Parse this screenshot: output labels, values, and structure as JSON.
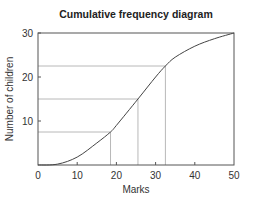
{
  "chart_data": {
    "type": "line",
    "title": "Cumulative frequency diagram",
    "xlabel": "Marks",
    "ylabel": "Number of children",
    "xlim": [
      0,
      50
    ],
    "ylim": [
      0,
      30
    ],
    "x_ticks": [
      0,
      10,
      20,
      30,
      40,
      50
    ],
    "y_ticks": [
      10,
      20,
      30
    ],
    "y_tick_labels": [
      "10",
      "20",
      "30"
    ],
    "x_tick_labels": [
      "0",
      "10",
      "20",
      "30",
      "40",
      "50"
    ],
    "grid": false,
    "legend": null,
    "series": [
      {
        "name": "Cumulative frequency",
        "x": [
          0,
          5,
          10,
          15,
          18.5,
          20,
          25.5,
          30,
          32.5,
          35,
          40,
          45,
          50
        ],
        "y": [
          0,
          0.2,
          1.8,
          5,
          7.5,
          9,
          15,
          20,
          22.5,
          24.5,
          27,
          28.7,
          30
        ]
      }
    ],
    "reference_lines": [
      {
        "y": 7.5,
        "x": 18.5,
        "label": "lower quartile"
      },
      {
        "y": 15,
        "x": 25.5,
        "label": "median"
      },
      {
        "y": 22.5,
        "x": 32.5,
        "label": "upper quartile"
      }
    ]
  }
}
